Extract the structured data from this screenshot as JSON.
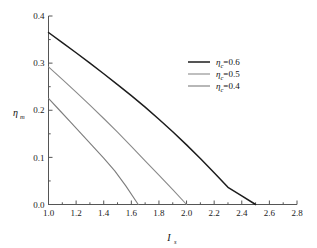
{
  "figure": {
    "top_caption_fragment": "",
    "background_color": "#ffffff"
  },
  "chart_data": {
    "type": "line",
    "title": "",
    "xlabel": "I",
    "xlabel_sub": "s",
    "ylabel": "η",
    "ylabel_sub": "m",
    "xlim": [
      1.0,
      2.8
    ],
    "ylim": [
      0.0,
      0.4
    ],
    "grid": false,
    "legend_position": "upper-right-inside",
    "x_ticks": [
      "1.0",
      "1.2",
      "1.4",
      "1.6",
      "1.8",
      "2.0",
      "2.2",
      "2.4",
      "2.6",
      "2.8"
    ],
    "x_tick_values": [
      1.0,
      1.2,
      1.4,
      1.6,
      1.8,
      2.0,
      2.2,
      2.4,
      2.6,
      2.8
    ],
    "x_minor_ticks": [
      1.1,
      1.3,
      1.5,
      1.7,
      1.9,
      2.1,
      2.3,
      2.5,
      2.7
    ],
    "y_ticks": [
      "0.0",
      "0.1",
      "0.2",
      "0.3",
      "0.4"
    ],
    "y_tick_values": [
      0.0,
      0.1,
      0.2,
      0.3,
      0.4
    ],
    "y_minor_ticks": [
      0.05,
      0.15,
      0.25,
      0.35
    ],
    "series": [
      {
        "name": "ηc=0.6",
        "legend_symbol": "η",
        "legend_sub": "c",
        "legend_value": "=0.6",
        "color": "#1c1c1c",
        "width": 1.5,
        "x": [
          1.0,
          1.1,
          1.2,
          1.3,
          1.4,
          1.5,
          1.6,
          1.7,
          1.8,
          1.9,
          2.0,
          2.1,
          2.2,
          2.3,
          2.4,
          2.5
        ],
        "y": [
          0.365,
          0.3435,
          0.322,
          0.3,
          0.2775,
          0.2545,
          0.231,
          0.2065,
          0.181,
          0.1545,
          0.1265,
          0.0975,
          0.0675,
          0.0365,
          0.0185,
          0.0
        ]
      },
      {
        "name": "ηc=0.5",
        "legend_symbol": "η",
        "legend_sub": "c",
        "legend_value": "=0.5",
        "color": "#8a8a8a",
        "width": 1.1,
        "x": [
          1.0,
          1.1,
          1.2,
          1.3,
          1.4,
          1.5,
          1.6,
          1.7,
          1.8,
          1.9,
          2.0
        ],
        "y": [
          0.292,
          0.2655,
          0.2385,
          0.211,
          0.1825,
          0.1535,
          0.1235,
          0.0925,
          0.0625,
          0.0315,
          0.0
        ]
      },
      {
        "name": "ηc=0.4",
        "legend_symbol": "η",
        "legend_sub": "c",
        "legend_value": "=0.4",
        "color": "#7d7d7d",
        "width": 1.1,
        "x": [
          1.0,
          1.08,
          1.16,
          1.24,
          1.32,
          1.4,
          1.48,
          1.56,
          1.65
        ],
        "y": [
          0.225,
          0.2,
          0.175,
          0.1495,
          0.124,
          0.0985,
          0.0715,
          0.0395,
          0.0
        ]
      }
    ]
  }
}
